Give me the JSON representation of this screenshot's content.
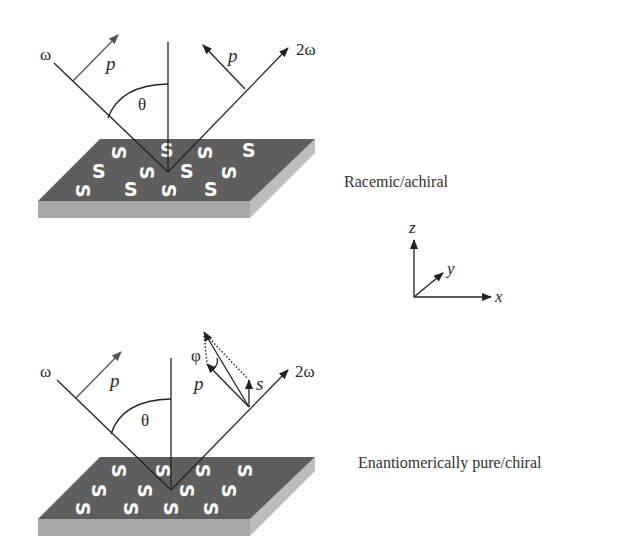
{
  "figure": {
    "top_panel": {
      "caption": "Racemic/achiral",
      "incident_label": "ω",
      "incident_polarization": "p",
      "angle_label": "θ",
      "output_label": "2ω",
      "output_polarization": "p",
      "molecule_glyph": "S",
      "molecule_glyph_alt": "S"
    },
    "bottom_panel": {
      "caption": "Enantiomerically pure/chiral",
      "incident_label": "ω",
      "incident_polarization": "p",
      "angle_label": "θ",
      "output_label": "2ω",
      "output_p_label": "p",
      "output_s_label": "s",
      "rotation_angle_label": "φ",
      "molecule_glyph": "S"
    },
    "axes": {
      "z_label": "z",
      "y_label": "y",
      "x_label": "x"
    },
    "colors": {
      "surface_top": "#5e5e5e",
      "surface_front": "#a8a8a8",
      "surface_side": "#b8b8b8",
      "molecule": "#ffffff",
      "lines": "#222222",
      "incident_arrow": "#555555"
    }
  }
}
